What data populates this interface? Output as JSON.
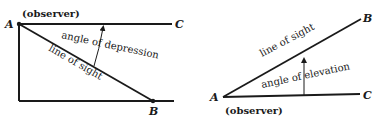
{
  "left_figure": {
    "point_a": "A",
    "point_b": "B",
    "point_c": "C",
    "observer": "(observer)",
    "angle_label": "angle of depression",
    "line_label": "line of sight"
  },
  "right_figure": {
    "point_a": "A",
    "point_b": "B",
    "point_c": "C",
    "observer": "(observer)",
    "angle_label": "angle of elevation",
    "line_label": "line of sight"
  },
  "colors": {
    "ink": "#1a1a1a",
    "background": "#ffffff"
  }
}
